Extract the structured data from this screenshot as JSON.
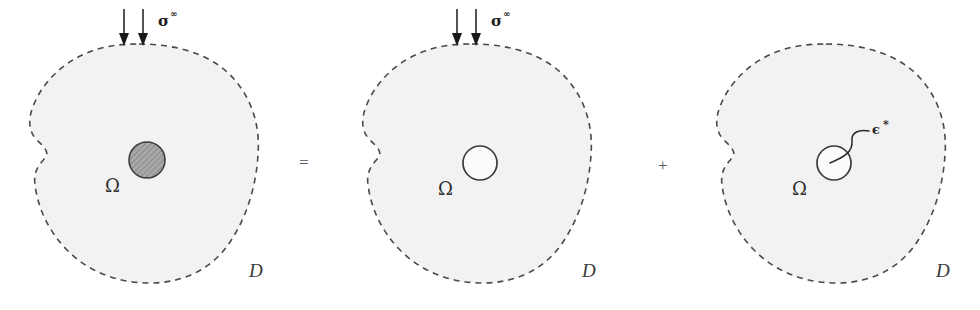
{
  "figure": {
    "background_color": "#ffffff",
    "blob_fill_color": "#f2f2f2",
    "blob_stroke_color": "#4a4a4a",
    "ink_color": "#1a1a1a"
  },
  "operators": [
    {
      "id": "equals",
      "symbol": "=",
      "name": "equals-operator"
    },
    {
      "id": "plus",
      "symbol": "+",
      "name": "plus-operator"
    }
  ],
  "panels": [
    {
      "id": "panel-inhomogeneity",
      "index": 1,
      "domain_label": "D",
      "inclusion_label": "Ω",
      "load_label": "σ",
      "load_superscript": "∞",
      "has_load_arrows": true,
      "arrow_count": 2,
      "inclusion_style": "hatched",
      "eigenstrain_label": null,
      "eigenstrain_superscript": null
    },
    {
      "id": "panel-homogeneous",
      "index": 2,
      "domain_label": "D",
      "inclusion_label": "Ω",
      "load_label": "σ",
      "load_superscript": "∞",
      "has_load_arrows": true,
      "arrow_count": 2,
      "inclusion_style": "open",
      "eigenstrain_label": null,
      "eigenstrain_superscript": null
    },
    {
      "id": "panel-eigenstrain",
      "index": 3,
      "domain_label": "D",
      "inclusion_label": "Ω",
      "load_label": null,
      "load_superscript": null,
      "has_load_arrows": false,
      "arrow_count": 0,
      "inclusion_style": "open",
      "eigenstrain_label": "ϵ",
      "eigenstrain_superscript": "*"
    }
  ]
}
